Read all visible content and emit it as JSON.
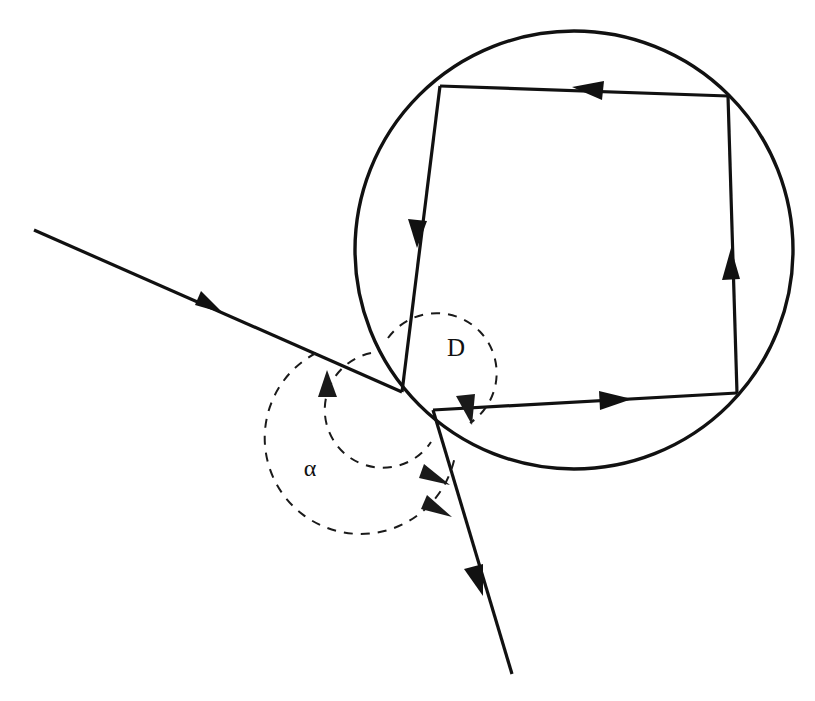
{
  "figure": {
    "background_color": "#ffffff",
    "line_color": "#111111",
    "dashed_color": "#1a1a1a",
    "width": 815,
    "height": 701
  },
  "labels": {
    "deviation": {
      "text": "D",
      "x": 456,
      "y": 356
    },
    "alpha": {
      "text": "α",
      "x": 310,
      "y": 476
    }
  },
  "chart_data": {
    "type": "diagram",
    "annotations": [
      "D",
      "α"
    ],
    "shapes": {
      "droplet_circle": {
        "cx": 574,
        "cy": 250,
        "r": 219
      },
      "incident_ray": {
        "x1": 34,
        "y1": 230,
        "x2": 402,
        "y2": 392,
        "arrow_at": [
          210,
          307
        ]
      },
      "exit_ray": {
        "x1": 433,
        "y1": 410,
        "x2": 512,
        "y2": 674,
        "arrow_at": [
          474,
          572
        ]
      },
      "internal_path": [
        {
          "name": "entry-to-top-left",
          "x1": 402,
          "y1": 392,
          "x2": 440,
          "y2": 86,
          "arrow_at": [
            419,
            236
          ]
        },
        {
          "name": "top-edge",
          "x1": 440,
          "y1": 86,
          "x2": 728,
          "y2": 96,
          "arrow_at": [
            590,
            91
          ]
        },
        {
          "name": "right-edge",
          "x1": 728,
          "y1": 96,
          "x2": 737,
          "y2": 393,
          "arrow_at": [
            733,
            263
          ]
        },
        {
          "name": "bottom-edge",
          "x1": 737,
          "y1": 393,
          "x2": 433,
          "y2": 410,
          "arrow_at": [
            612,
            401
          ]
        }
      ],
      "alpha_arc": {
        "cx": 402,
        "cy": 392,
        "r": 96,
        "from_deg": 204,
        "to_deg": 67
      },
      "alpha_inner_arc": {
        "cx": 402,
        "cy": 392,
        "r": 58,
        "from_deg": 204,
        "to_deg": 50
      },
      "deviation_arc": {
        "cx": 402,
        "cy": 392,
        "r": 60,
        "from_deg": 285,
        "to_deg": 15
      }
    },
    "xlabel": "",
    "ylabel": "",
    "grid": false,
    "legend": "none"
  }
}
